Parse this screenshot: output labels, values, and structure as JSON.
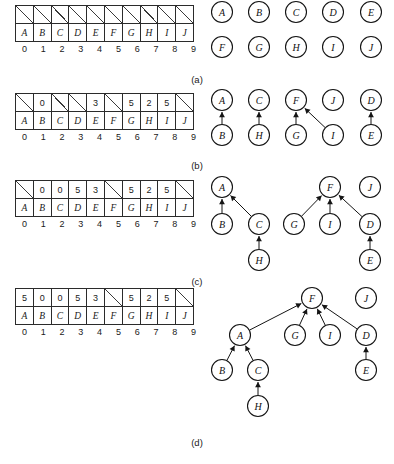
{
  "figure": {
    "captions": [
      "(a)",
      "(b)",
      "(c)",
      "(d)"
    ]
  },
  "array": {
    "index_header": [
      "0",
      "1",
      "2",
      "3",
      "4",
      "5",
      "6",
      "7",
      "8",
      "9"
    ],
    "element_labels": [
      "A",
      "B",
      "C",
      "D",
      "E",
      "F",
      "G",
      "H",
      "I",
      "J"
    ],
    "empty_marker": "slash"
  },
  "panels": [
    {
      "id": "a",
      "caption": "(a)",
      "parent_row": [
        null,
        null,
        null,
        null,
        null,
        null,
        null,
        null,
        null,
        null
      ],
      "element_row": [
        "A",
        "B",
        "C",
        "D",
        "E",
        "F",
        "G",
        "H",
        "I",
        "J"
      ],
      "index_row": [
        "0",
        "1",
        "2",
        "3",
        "4",
        "5",
        "6",
        "7",
        "8",
        "9"
      ],
      "nodes": [
        {
          "label": "A",
          "x": 222,
          "y": 15
        },
        {
          "label": "B",
          "x": 259,
          "y": 15
        },
        {
          "label": "C",
          "x": 296,
          "y": 15
        },
        {
          "label": "D",
          "x": 333,
          "y": 15
        },
        {
          "label": "E",
          "x": 371,
          "y": 15
        },
        {
          "label": "F",
          "x": 222,
          "y": 50
        },
        {
          "label": "G",
          "x": 259,
          "y": 50
        },
        {
          "label": "H",
          "x": 296,
          "y": 50
        },
        {
          "label": "I",
          "x": 333,
          "y": 50
        },
        {
          "label": "J",
          "x": 371,
          "y": 50
        }
      ],
      "edges": []
    },
    {
      "id": "b",
      "caption": "(b)",
      "parent_row": [
        null,
        "0",
        null,
        null,
        "3",
        null,
        "5",
        "2",
        "5",
        null
      ],
      "element_row": [
        "A",
        "B",
        "C",
        "D",
        "E",
        "F",
        "G",
        "H",
        "I",
        "J"
      ],
      "index_row": [
        "0",
        "1",
        "2",
        "3",
        "4",
        "5",
        "6",
        "7",
        "8",
        "9"
      ],
      "nodes": [
        {
          "label": "A",
          "x": 222,
          "y": 15
        },
        {
          "label": "C",
          "x": 259,
          "y": 15
        },
        {
          "label": "F",
          "x": 296,
          "y": 15
        },
        {
          "label": "J",
          "x": 333,
          "y": 15
        },
        {
          "label": "D",
          "x": 371,
          "y": 15
        },
        {
          "label": "B",
          "x": 222,
          "y": 50
        },
        {
          "label": "H",
          "x": 259,
          "y": 50
        },
        {
          "label": "G",
          "x": 296,
          "y": 50
        },
        {
          "label": "I",
          "x": 333,
          "y": 50
        },
        {
          "label": "E",
          "x": 371,
          "y": 50
        }
      ],
      "edges": [
        {
          "from": "B",
          "to": "A"
        },
        {
          "from": "H",
          "to": "C"
        },
        {
          "from": "G",
          "to": "F"
        },
        {
          "from": "I",
          "to": "F"
        },
        {
          "from": "E",
          "to": "D"
        }
      ]
    },
    {
      "id": "c",
      "caption": "(c)",
      "parent_row": [
        null,
        "0",
        "0",
        "5",
        "3",
        null,
        "5",
        "2",
        "5",
        null
      ],
      "element_row": [
        "A",
        "B",
        "C",
        "D",
        "E",
        "F",
        "G",
        "H",
        "I",
        "J"
      ],
      "index_row": [
        "0",
        "1",
        "2",
        "3",
        "4",
        "5",
        "6",
        "7",
        "8",
        "9"
      ],
      "nodes": [
        {
          "label": "A",
          "x": 222,
          "y": 15
        },
        {
          "label": "F",
          "x": 330,
          "y": 15
        },
        {
          "label": "J",
          "x": 370,
          "y": 15
        },
        {
          "label": "B",
          "x": 222,
          "y": 52
        },
        {
          "label": "C",
          "x": 259,
          "y": 52
        },
        {
          "label": "G",
          "x": 294,
          "y": 52
        },
        {
          "label": "I",
          "x": 330,
          "y": 52
        },
        {
          "label": "D",
          "x": 370,
          "y": 52
        },
        {
          "label": "H",
          "x": 259,
          "y": 88
        },
        {
          "label": "E",
          "x": 370,
          "y": 88
        }
      ],
      "edges": [
        {
          "from": "B",
          "to": "A"
        },
        {
          "from": "C",
          "to": "A"
        },
        {
          "from": "H",
          "to": "C"
        },
        {
          "from": "G",
          "to": "F"
        },
        {
          "from": "I",
          "to": "F"
        },
        {
          "from": "D",
          "to": "F"
        },
        {
          "from": "E",
          "to": "D"
        }
      ]
    },
    {
      "id": "d",
      "caption": "(d)",
      "parent_row": [
        "5",
        "0",
        "0",
        "5",
        "3",
        null,
        "5",
        "2",
        "5",
        null
      ],
      "element_row": [
        "A",
        "B",
        "C",
        "D",
        "E",
        "F",
        "G",
        "H",
        "I",
        "J"
      ],
      "index_row": [
        "0",
        "1",
        "2",
        "3",
        "4",
        "5",
        "6",
        "7",
        "8",
        "9"
      ],
      "nodes": [
        {
          "label": "F",
          "x": 312,
          "y": 18
        },
        {
          "label": "J",
          "x": 366,
          "y": 18
        },
        {
          "label": "A",
          "x": 240,
          "y": 55
        },
        {
          "label": "G",
          "x": 295,
          "y": 55
        },
        {
          "label": "I",
          "x": 330,
          "y": 55
        },
        {
          "label": "D",
          "x": 366,
          "y": 55
        },
        {
          "label": "B",
          "x": 222,
          "y": 90
        },
        {
          "label": "C",
          "x": 258,
          "y": 90
        },
        {
          "label": "E",
          "x": 366,
          "y": 90
        },
        {
          "label": "H",
          "x": 258,
          "y": 126
        }
      ],
      "edges": [
        {
          "from": "A",
          "to": "F"
        },
        {
          "from": "G",
          "to": "F"
        },
        {
          "from": "I",
          "to": "F"
        },
        {
          "from": "D",
          "to": "F"
        },
        {
          "from": "B",
          "to": "A"
        },
        {
          "from": "C",
          "to": "A"
        },
        {
          "from": "H",
          "to": "C"
        },
        {
          "from": "E",
          "to": "D"
        }
      ]
    }
  ],
  "layout": {
    "panel_tops": [
      5,
      93,
      180,
      288
    ],
    "caption_tops": [
      74,
      160,
      276,
      437
    ],
    "array_left": 15,
    "node_radius": 10.5
  }
}
